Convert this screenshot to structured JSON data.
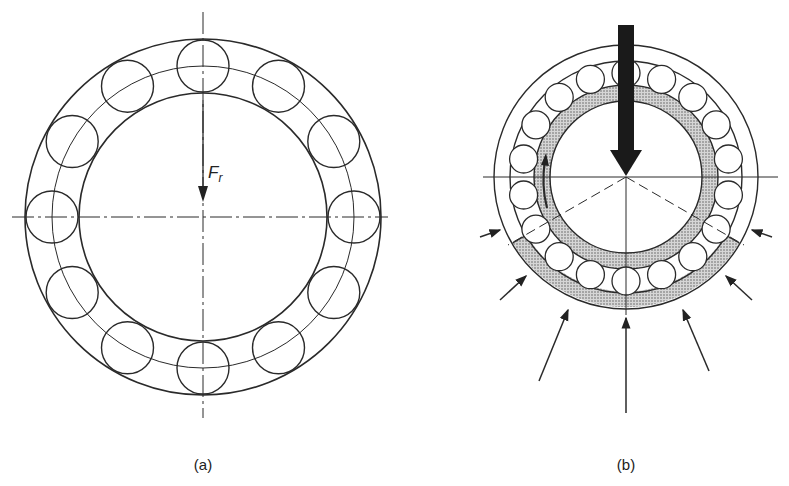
{
  "figure_a": {
    "caption": "(a)",
    "force_label": "F",
    "force_subscript": "r",
    "ball_count": 12
  },
  "figure_b": {
    "caption": "(b)",
    "roller_count": 18
  },
  "colors": {
    "line": "#2a2a2a",
    "load_arrow": "#1a1a1a",
    "stipple": "#b8b8b8",
    "background": "#ffffff"
  }
}
